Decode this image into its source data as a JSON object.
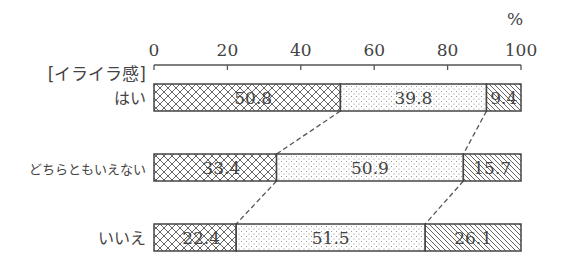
{
  "chart_data": {
    "type": "bar",
    "orientation": "horizontal",
    "stacked": true,
    "unit": "%",
    "group_title": "[イライラ感]",
    "categories": [
      "はい",
      "どちらともいえない",
      "いいえ"
    ],
    "series": [
      {
        "name": "segment-1",
        "pattern": "crosshatch",
        "values": [
          50.8,
          33.4,
          22.4
        ]
      },
      {
        "name": "segment-2",
        "pattern": "dots",
        "values": [
          39.8,
          50.9,
          51.5
        ]
      },
      {
        "name": "segment-3",
        "pattern": "diagonal",
        "values": [
          9.4,
          15.7,
          26.1
        ]
      }
    ],
    "x_ticks": [
      0,
      20,
      40,
      60,
      80,
      100
    ],
    "xlim": [
      0,
      100
    ],
    "connectors": "dashed lines linking segment boundaries between adjacent bars",
    "legend": "none",
    "grid": false
  },
  "colors": {
    "ink": "#444444",
    "background": "#ffffff"
  }
}
